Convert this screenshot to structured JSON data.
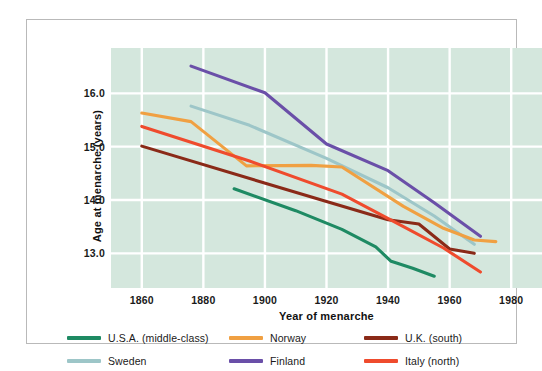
{
  "chart_data": {
    "type": "line",
    "title": "",
    "xlabel": "Year of menarche",
    "ylabel": "Age at menarche (years)",
    "xlim": [
      1850,
      1990
    ],
    "ylim": [
      12.35,
      16.85
    ],
    "xticks": [
      "1860",
      "1880",
      "1900",
      "1920",
      "1940",
      "1960",
      "1980"
    ],
    "yticks": [
      "16.0",
      "15.0",
      "14.0",
      "13.0"
    ],
    "grid": true,
    "legend_position": "below-plot",
    "plot_background": "#d4e7dd",
    "gridline_color": "#ffffff",
    "series": [
      {
        "name": "U.S.A. (middle-class)",
        "color": "#1e8a63",
        "x": [
          1890,
          1910,
          1925,
          1936,
          1941,
          1948,
          1955
        ],
        "y": [
          14.21,
          13.8,
          13.45,
          13.12,
          12.85,
          12.72,
          12.57
        ]
      },
      {
        "name": "Sweden",
        "color": "#9dc6c8",
        "x": [
          1876,
          1895,
          1920,
          1940,
          1955,
          1968
        ],
        "y": [
          15.76,
          15.4,
          14.78,
          14.23,
          13.7,
          13.17
        ]
      },
      {
        "name": "Norway",
        "color": "#f0a042",
        "x": [
          1860,
          1876,
          1894,
          1915,
          1925,
          1945,
          1958,
          1968,
          1975
        ],
        "y": [
          15.63,
          15.47,
          14.64,
          14.65,
          14.62,
          13.88,
          13.47,
          13.25,
          13.22
        ]
      },
      {
        "name": "Finland",
        "color": "#6a4fa8",
        "x": [
          1876,
          1900,
          1920,
          1940,
          1955,
          1970
        ],
        "y": [
          16.51,
          16.01,
          15.05,
          14.55,
          13.95,
          13.32
        ]
      },
      {
        "name": "U.K. (south)",
        "color": "#8a2a18",
        "x": [
          1860,
          1920,
          1940,
          1950,
          1960,
          1968
        ],
        "y": [
          15.01,
          13.97,
          13.63,
          13.55,
          13.08,
          13.0
        ]
      },
      {
        "name": "Italy (north)",
        "color": "#ef4b2d",
        "x": [
          1860,
          1895,
          1925,
          1945,
          1958,
          1970
        ],
        "y": [
          15.38,
          14.73,
          14.11,
          13.5,
          13.1,
          12.65
        ]
      }
    ]
  },
  "legend": {
    "items": [
      {
        "label": "U.S.A. (middle-class)",
        "color": "#1e8a63"
      },
      {
        "label": "Norway",
        "color": "#f0a042"
      },
      {
        "label": "U.K. (south)",
        "color": "#8a2a18"
      },
      {
        "label": "Sweden",
        "color": "#9dc6c8"
      },
      {
        "label": "Finland",
        "color": "#6a4fa8"
      },
      {
        "label": "Italy (north)",
        "color": "#ef4b2d"
      }
    ]
  }
}
